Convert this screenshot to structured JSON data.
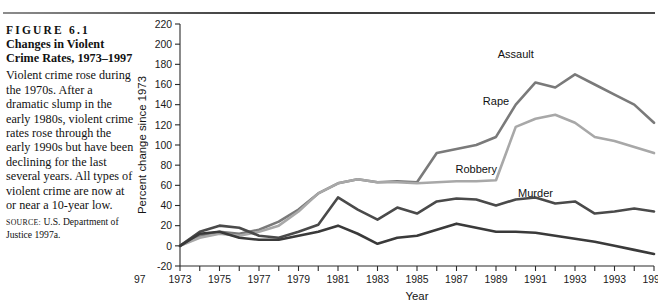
{
  "figure": {
    "number": "FIGURE 6.1",
    "title_line1": "Changes in Violent",
    "title_line2": "Crime Rates, 1973–1997",
    "description": "Violent crime rose during the 1970s. After a dramatic slump in the early 1980s, violent crime rates rose through the early 1990s but have been declining for the last several years. All types of violent crime are now at or near a 10-year low.",
    "source_kicker": "SOURCE:",
    "source_text": "U.S. Department of Justice 1997a."
  },
  "chart_data": {
    "type": "line",
    "title": "Changes in Violent Crime Rates, 1973–1997",
    "xlabel": "Year",
    "ylabel": "Percent change since 1973",
    "xlim": [
      1973,
      1997
    ],
    "ylim": [
      -20,
      220
    ],
    "ytick_step": 20,
    "yticks": [
      -20,
      0,
      20,
      40,
      60,
      80,
      100,
      120,
      140,
      160,
      180,
      200,
      220
    ],
    "xticks": [
      1973,
      1974,
      1975,
      1976,
      1977,
      1978,
      1979,
      1980,
      1981,
      1982,
      1983,
      1984,
      1985,
      1986,
      1987,
      1988,
      1989,
      1990,
      1991,
      1992,
      1993,
      1994,
      1995,
      1996,
      1997
    ],
    "xtick_labels": [
      "1973",
      "1975",
      "1977",
      "1979",
      "1981",
      "1983",
      "1985",
      "1987",
      "1989",
      "1991",
      "1993",
      "1993",
      "1995",
      "1997"
    ],
    "grid": false,
    "legend_position": "inline-labels",
    "x": [
      1973,
      1974,
      1975,
      1976,
      1977,
      1978,
      1979,
      1980,
      1981,
      1982,
      1983,
      1984,
      1985,
      1986,
      1987,
      1988,
      1989,
      1990,
      1991,
      1992,
      1993,
      1994,
      1995,
      1996,
      1997
    ],
    "series": [
      {
        "name": "Assault",
        "color": "#7a7a7a",
        "label_x": 1990,
        "label_y": 186,
        "values": [
          0,
          10,
          14,
          12,
          16,
          24,
          36,
          52,
          62,
          66,
          63,
          64,
          63,
          92,
          96,
          100,
          108,
          140,
          162,
          157,
          170,
          160,
          150,
          140,
          122
        ]
      },
      {
        "name": "Rape",
        "color": "#a8a8a8",
        "label_x": 1989,
        "label_y": 140,
        "values": [
          0,
          8,
          12,
          10,
          14,
          20,
          34,
          52,
          62,
          66,
          63,
          63,
          62,
          63,
          64,
          64,
          65,
          118,
          126,
          130,
          122,
          108,
          104,
          98,
          92
        ]
      },
      {
        "name": "Robbery",
        "color": "#4a4a4a",
        "label_x": 1988,
        "label_y": 72,
        "values": [
          0,
          14,
          20,
          18,
          10,
          8,
          14,
          21,
          48,
          36,
          26,
          38,
          32,
          44,
          47,
          46,
          40,
          46,
          48,
          42,
          44,
          32,
          34,
          37,
          34
        ]
      },
      {
        "name": "Murder",
        "color": "#3a3a3a",
        "label_x": 1991,
        "label_y": 48,
        "values": [
          0,
          12,
          14,
          8,
          6,
          6,
          10,
          14,
          20,
          12,
          2,
          8,
          10,
          16,
          22,
          18,
          14,
          14,
          13,
          10,
          7,
          4,
          0,
          -4,
          -8
        ]
      }
    ]
  }
}
